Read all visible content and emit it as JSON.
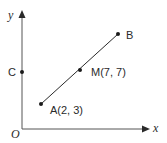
{
  "diagram": {
    "axes": {
      "x_label": "x",
      "y_label": "y",
      "origin_label": "O"
    },
    "points": {
      "A": {
        "label": "A(2, 3)",
        "x": 2,
        "y": 3
      },
      "M": {
        "label": "M(7, 7)",
        "x": 7,
        "y": 7
      },
      "B": {
        "label": "B"
      },
      "C": {
        "label": "C"
      }
    },
    "segments": [
      {
        "from": "A",
        "to": "B",
        "midpoint": "M"
      }
    ],
    "colors": {
      "stroke": "#2a2a2a",
      "background": "#ffffff"
    }
  }
}
